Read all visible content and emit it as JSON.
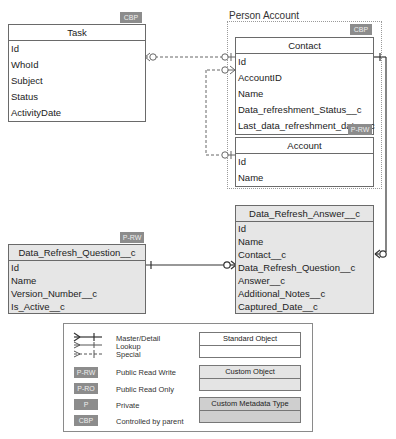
{
  "group": {
    "label": "Person Account"
  },
  "entities": {
    "task": {
      "title": "Task",
      "badge": "CBP",
      "fields": [
        "Id",
        "WhoId",
        "Subject",
        "Status",
        "ActivityDate"
      ]
    },
    "contact": {
      "title": "Contact",
      "badge": "CBP",
      "fields": [
        "Id",
        "AccountID",
        "Name",
        "Data_refreshment_Status__c",
        "Last_data_refreshment_date__c"
      ]
    },
    "account": {
      "title": "Account",
      "badge": "P-RW",
      "fields": [
        "Id",
        "Name"
      ]
    },
    "answer": {
      "title": "Data_Refresh_Answer__c",
      "fields": [
        "Id",
        "Name",
        "Contact__c",
        "Data_Refresh_Question__c",
        "Answer__c",
        "Additional_Notes__c",
        "Captured_Date__c"
      ]
    },
    "question": {
      "title": "Data_Refresh_Question__c",
      "badge": "P-RW",
      "fields": [
        "Id",
        "Name",
        "Version_Number__c",
        "Is_Active__c"
      ]
    }
  },
  "relationships": [
    {
      "from": "Task.WhoId",
      "to": "Contact.Id",
      "type": "lookup"
    },
    {
      "from": "Contact.AccountID",
      "to": "Account.Id",
      "type": "lookup"
    },
    {
      "from": "Data_Refresh_Answer__c.Contact__c",
      "to": "Contact.Id",
      "type": "master-detail"
    },
    {
      "from": "Data_Refresh_Answer__c.Data_Refresh_Question__c",
      "to": "Data_Refresh_Question__c.Id",
      "type": "master-detail"
    }
  ],
  "legend": {
    "line_types": [
      "Master/Detail",
      "Lookup",
      "Special"
    ],
    "badges": [
      {
        "code": "P-RW",
        "label": "Public Read Write"
      },
      {
        "code": "P-RO",
        "label": "Public Read Only"
      },
      {
        "code": "P",
        "label": "Private"
      },
      {
        "code": "CBP",
        "label": "Controlled by parent"
      }
    ],
    "object_types": [
      "Standard Object",
      "Custom Object",
      "Custom Metadata Type"
    ]
  }
}
